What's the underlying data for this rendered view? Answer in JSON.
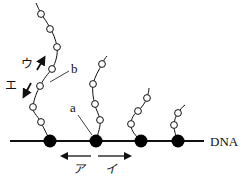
{
  "diagram": {
    "dna_label": "DNA",
    "labels": {
      "a": "a",
      "b": "b",
      "a_katakana": "ア",
      "i_katakana": "イ",
      "u_katakana": "ウ",
      "e_katakana": "エ"
    },
    "polymerases": [
      {
        "x": 50,
        "y": 141
      },
      {
        "x": 96,
        "y": 141
      },
      {
        "x": 141,
        "y": 141
      },
      {
        "x": 178,
        "y": 141
      }
    ],
    "strands": [
      {
        "name": "strand-1",
        "points": [
          [
            50,
            141
          ],
          [
            41,
            122
          ],
          [
            33,
            107
          ],
          [
            40,
            86
          ],
          [
            52,
            69
          ],
          [
            57,
            47
          ],
          [
            50,
            28
          ],
          [
            41,
            14
          ],
          [
            36,
            3
          ]
        ],
        "beads": [
          [
            41,
            122
          ],
          [
            33,
            107
          ],
          [
            40,
            86
          ],
          [
            52,
            69
          ],
          [
            57,
            47
          ],
          [
            50,
            28
          ],
          [
            41,
            14
          ]
        ]
      },
      {
        "name": "strand-2",
        "points": [
          [
            96,
            141
          ],
          [
            100,
            120
          ],
          [
            95,
            105
          ],
          [
            93,
            84
          ],
          [
            102,
            64
          ],
          [
            107,
            56
          ]
        ],
        "beads": [
          [
            100,
            120
          ],
          [
            95,
            105
          ],
          [
            93,
            84
          ],
          [
            102,
            64
          ]
        ]
      },
      {
        "name": "strand-3",
        "points": [
          [
            141,
            141
          ],
          [
            131,
            127
          ],
          [
            131,
            117
          ],
          [
            138,
            109
          ],
          [
            147,
            97
          ],
          [
            149,
            88
          ]
        ],
        "beads": [
          [
            131,
            124
          ],
          [
            138,
            111
          ],
          [
            147,
            98
          ]
        ]
      },
      {
        "name": "strand-4",
        "points": [
          [
            178,
            141
          ],
          [
            174,
            126
          ],
          [
            178,
            113
          ],
          [
            184,
            105
          ]
        ],
        "beads": [
          [
            174,
            125
          ],
          [
            178,
            113
          ]
        ]
      }
    ],
    "colors": {
      "line": "#111111",
      "bead_fill": "#ffffff",
      "polymerase": "#000000"
    }
  }
}
